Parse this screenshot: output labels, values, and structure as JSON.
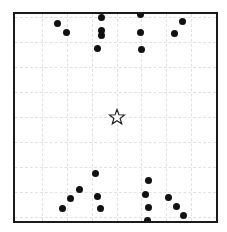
{
  "board": {
    "frame": {
      "left": 13,
      "top": 12,
      "right": 217,
      "bottom": 222
    },
    "border_color": "#1a1a1a",
    "grid_color": "#e2e2e2",
    "grid_spacing": 25,
    "grid_x": [
      42,
      67,
      92,
      117,
      141,
      166,
      191
    ],
    "grid_y": [
      17,
      42,
      67,
      92,
      117,
      142,
      167,
      192,
      217
    ]
  },
  "target": {
    "icon": "star-outline-icon",
    "x": 117,
    "y": 117,
    "fill": "#ffffff",
    "stroke": "#222222"
  },
  "dots": {
    "color": "#111111",
    "top_group": [
      {
        "x": 57,
        "y": 23
      },
      {
        "x": 66,
        "y": 32
      },
      {
        "x": 101,
        "y": 17
      },
      {
        "x": 101,
        "y": 30
      },
      {
        "x": 101,
        "y": 35
      },
      {
        "x": 97,
        "y": 48
      },
      {
        "x": 140,
        "y": 14
      },
      {
        "x": 140,
        "y": 32
      },
      {
        "x": 141,
        "y": 49
      },
      {
        "x": 182,
        "y": 21
      },
      {
        "x": 174,
        "y": 33
      }
    ],
    "bottom_group": [
      {
        "x": 95,
        "y": 173
      },
      {
        "x": 79,
        "y": 189
      },
      {
        "x": 97,
        "y": 196
      },
      {
        "x": 70,
        "y": 198
      },
      {
        "x": 62,
        "y": 208
      },
      {
        "x": 100,
        "y": 208
      },
      {
        "x": 148,
        "y": 180
      },
      {
        "x": 145,
        "y": 194
      },
      {
        "x": 168,
        "y": 197
      },
      {
        "x": 148,
        "y": 207
      },
      {
        "x": 176,
        "y": 206
      },
      {
        "x": 183,
        "y": 215
      },
      {
        "x": 147,
        "y": 220
      }
    ]
  }
}
